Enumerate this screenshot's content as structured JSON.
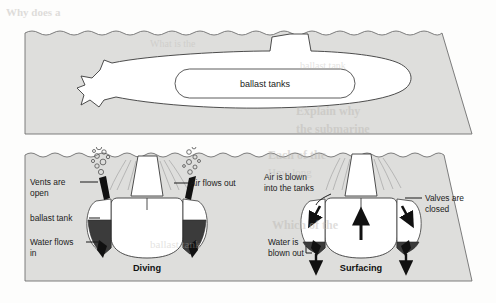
{
  "figure": {
    "media": "scanned-textbook-page",
    "page_background": "#fdfdfc"
  },
  "colors": {
    "sea_fill": "#dededc",
    "sea_outline": "#6f6f6f",
    "hull_fill": "#ffffff",
    "hull_outline": "#3a3a3a",
    "water_in_tank": "#3b3b3b",
    "air_in_tank": "#ffffff",
    "label_text": "#1b1b1b",
    "ghost_text": "#b9b6b1"
  },
  "panels": [
    {
      "id": "side-view",
      "name": "submarine-side-view",
      "labels": [
        {
          "id": "ballast-tanks",
          "text": "ballast tanks"
        }
      ]
    },
    {
      "id": "cross-sections",
      "name": "submarine-cross-sections",
      "scenes": [
        {
          "id": "diving",
          "caption": "Diving",
          "labels": [
            {
              "id": "vents-open",
              "lines": [
                "Vents are",
                "open"
              ]
            },
            {
              "id": "ballast-tank",
              "lines": [
                "ballast tank"
              ]
            },
            {
              "id": "water-flows-in",
              "lines": [
                "Water flows",
                "in"
              ]
            },
            {
              "id": "air-flows-out",
              "lines": [
                "Air flows out"
              ]
            }
          ]
        },
        {
          "id": "surfacing",
          "caption": "Surfacing",
          "labels": [
            {
              "id": "air-blown-in",
              "lines": [
                "Air is blown",
                "into the tanks"
              ]
            },
            {
              "id": "valves-closed",
              "lines": [
                "Valves are",
                "closed"
              ]
            },
            {
              "id": "water-blown-out",
              "lines": [
                "Water is",
                "blown out"
              ]
            }
          ]
        }
      ]
    }
  ],
  "label_text": {
    "ballast_tanks": "ballast tanks",
    "vents_are": "Vents are",
    "open": "open",
    "ballast_tank": "ballast tank",
    "water_flows": "Water flows",
    "in": "in",
    "air_flows_out": "Air flows out",
    "air_is_blown": "Air is blown",
    "into_the_tanks": "into the tanks",
    "valves_are": "Valves are",
    "closed": "closed",
    "water_is": "Water is",
    "blown_out": "blown out",
    "diving": "Diving",
    "surfacing": "Surfacing"
  },
  "bleed_through": {
    "note": "faint mirrored text showing through from the reverse side of the page",
    "lines": [
      {
        "id": "g1",
        "text": "Why does a"
      },
      {
        "id": "g2",
        "text": "What is the"
      },
      {
        "id": "g3",
        "text": "ballast tank"
      },
      {
        "id": "g4",
        "text": "Explain why"
      },
      {
        "id": "g5",
        "text": "the submarine"
      },
      {
        "id": "g6",
        "text": "Each of the"
      },
      {
        "id": "g7",
        "text": "How long"
      },
      {
        "id": "g8",
        "text": "Which of the"
      }
    ]
  }
}
